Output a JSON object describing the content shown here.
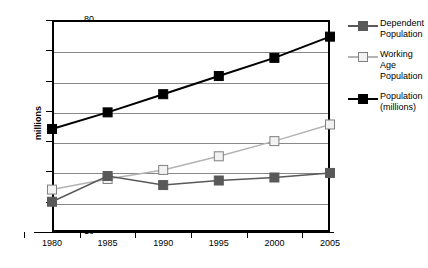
{
  "chart_data": {
    "type": "line",
    "title": "",
    "xlabel": "",
    "ylabel": "millions",
    "categories": [
      "1980",
      "1985",
      "1990",
      "1995",
      "2000",
      "2005"
    ],
    "x": [
      1980,
      1985,
      1990,
      1995,
      2000,
      2005
    ],
    "xlim": [
      1980,
      2005
    ],
    "ylim": [
      10,
      80
    ],
    "yticks": [
      10,
      20,
      30,
      40,
      50,
      60,
      70,
      80
    ],
    "ytick_labels": [
      "10",
      "20",
      "30",
      "40",
      "50",
      "60",
      "70",
      "80"
    ],
    "grid": true,
    "legend_position": "right",
    "series": [
      {
        "name": "Dependent Population",
        "values": [
          20,
          28.5,
          25.5,
          27,
          28,
          29.5
        ],
        "color": "#595959",
        "marker": "square-filled",
        "line_color": "#595959"
      },
      {
        "name": "Working Age Population",
        "values": [
          24,
          27.5,
          30.5,
          35,
          40,
          45.5
        ],
        "color": "#f2f2f2",
        "marker": "square-open",
        "line_color": "#b3b3b3"
      },
      {
        "name": "Population (millions)",
        "values": [
          44,
          49.5,
          55.5,
          61.5,
          67.5,
          74.5
        ],
        "color": "#000000",
        "marker": "square-filled",
        "line_color": "#000000"
      }
    ]
  },
  "legend": {
    "entries": [
      {
        "label": "Dependent Population"
      },
      {
        "label": "Working Age Population"
      },
      {
        "label": "Population (millions)"
      }
    ]
  }
}
